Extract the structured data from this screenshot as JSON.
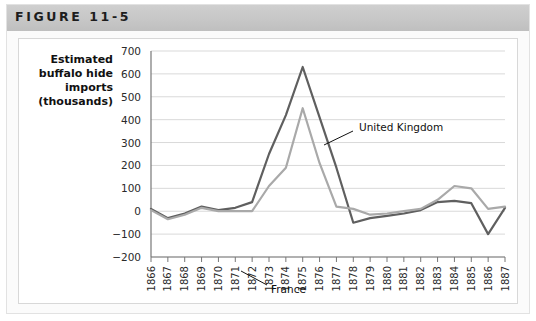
{
  "figure": {
    "title": "FIGURE 11-5",
    "header_color": "#c6c6c6",
    "frame_color": "#e2e2e2",
    "background": "#ffffff"
  },
  "chart_data": {
    "type": "line",
    "title": "",
    "xlabel": "",
    "ylabel": "Estimated buffalo hide imports (thousands)",
    "ylabel_lines": [
      "Estimated",
      "buffalo hide",
      "imports",
      "(thousands)"
    ],
    "grid": true,
    "legend_position": "inline-annotation",
    "ylim": [
      -200,
      700
    ],
    "yticks": [
      700,
      600,
      500,
      400,
      300,
      200,
      100,
      0,
      -100,
      -200
    ],
    "ytick_labels": [
      "700",
      "600",
      "500",
      "400",
      "300",
      "200",
      "100",
      "0",
      "−100",
      "−200"
    ],
    "categories": [
      "1866",
      "1867",
      "1868",
      "1869",
      "1870",
      "1871",
      "1872",
      "1873",
      "1874",
      "1875",
      "1876",
      "1877",
      "1878",
      "1879",
      "1880",
      "1881",
      "1882",
      "1883",
      "1884",
      "1885",
      "1886",
      "1887"
    ],
    "x": [
      1866,
      1867,
      1868,
      1869,
      1870,
      1871,
      1872,
      1873,
      1874,
      1875,
      1876,
      1877,
      1878,
      1879,
      1880,
      1881,
      1882,
      1883,
      1884,
      1885,
      1886,
      1887
    ],
    "series": [
      {
        "name": "United Kingdom",
        "color": "#5f5f5f",
        "width": 2.2,
        "values": [
          10,
          -30,
          -10,
          20,
          5,
          15,
          40,
          250,
          420,
          630,
          410,
          190,
          -50,
          -30,
          -20,
          -10,
          5,
          40,
          45,
          35,
          -100,
          15
        ],
        "label_anchor_index": 10,
        "label_x": 340,
        "label_y": 88
      },
      {
        "name": "France",
        "color": "#a9a9a9",
        "width": 2.2,
        "values": [
          5,
          -35,
          -15,
          15,
          0,
          0,
          0,
          110,
          190,
          450,
          210,
          20,
          10,
          -15,
          -10,
          0,
          10,
          50,
          110,
          100,
          10,
          20
        ],
        "label_anchor_index": 6,
        "label_x": 252,
        "label_y": 249
      }
    ],
    "annotations": [
      {
        "text": "United Kingdom",
        "x": 340,
        "y": 88,
        "leader_from_x": 334,
        "leader_from_y": 92,
        "leader_to_x": 305,
        "leader_to_y": 106
      },
      {
        "text": "France",
        "x": 252,
        "y": 250,
        "leader_from_x": 248,
        "leader_from_y": 246,
        "leader_to_x": 222,
        "leader_to_y": 232
      }
    ]
  }
}
